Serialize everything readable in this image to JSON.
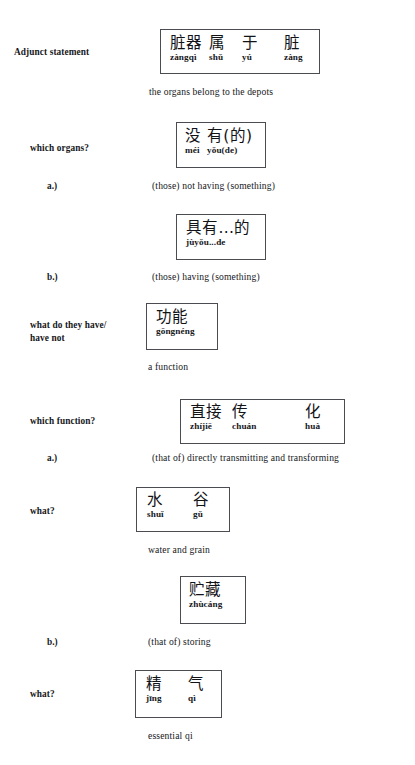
{
  "document": {
    "kind": "interlinear-chinese-grammar-tree",
    "language_pair": "Chinese – English"
  },
  "rows": [
    {
      "label": "Adjunct statement",
      "enumerator": "",
      "box": {
        "cells": [
          {
            "han": "脏器",
            "pinyin": "zàngqì"
          },
          {
            "han": "属",
            "pinyin": "shǔ"
          },
          {
            "han": "于",
            "pinyin": "yú"
          },
          {
            "han": "脏",
            "pinyin": "zàng"
          }
        ]
      },
      "gloss": "the organs belong to   the depots"
    },
    {
      "label": "which organs?",
      "enumerator": "a.)",
      "box": {
        "cells": [
          {
            "han": "没",
            "pinyin": "méi"
          },
          {
            "han": "有(的)",
            "pinyin": "yǒu(de)"
          }
        ]
      },
      "gloss": "(those) not  having (something)"
    },
    {
      "label": "",
      "enumerator": "b.)",
      "box": {
        "cells": [
          {
            "han": "具有...的",
            "pinyin": "jùyǒu...de"
          }
        ]
      },
      "gloss": "(those) having (something)"
    },
    {
      "label": "what do they have/\nhave not",
      "enumerator": "",
      "box": {
        "cells": [
          {
            "han": "功能",
            "pinyin": "gōngnéng"
          }
        ]
      },
      "gloss": "a function"
    },
    {
      "label": "which function?",
      "enumerator": "a.)",
      "box": {
        "cells": [
          {
            "han": "直接",
            "pinyin": "zhíjiē"
          },
          {
            "han": "传",
            "pinyin": "chuán"
          },
          {
            "han": "化",
            "pinyin": "huà"
          }
        ]
      },
      "gloss": "(that of) directly transmitting and  transforming"
    },
    {
      "label": "what?",
      "enumerator": "",
      "box": {
        "cells": [
          {
            "han": "水",
            "pinyin": "shuǐ"
          },
          {
            "han": "谷",
            "pinyin": "gǔ"
          }
        ]
      },
      "gloss": "water and  grain"
    },
    {
      "label": "",
      "enumerator": "b.)",
      "box": {
        "cells": [
          {
            "han": "贮藏",
            "pinyin": "zhùcáng"
          }
        ]
      },
      "gloss": "(that of) storing"
    },
    {
      "label": "what?",
      "enumerator": "",
      "box": {
        "cells": [
          {
            "han": "精",
            "pinyin": "jīng"
          },
          {
            "han": "气",
            "pinyin": "qì"
          }
        ]
      },
      "gloss": "essential qi"
    }
  ]
}
